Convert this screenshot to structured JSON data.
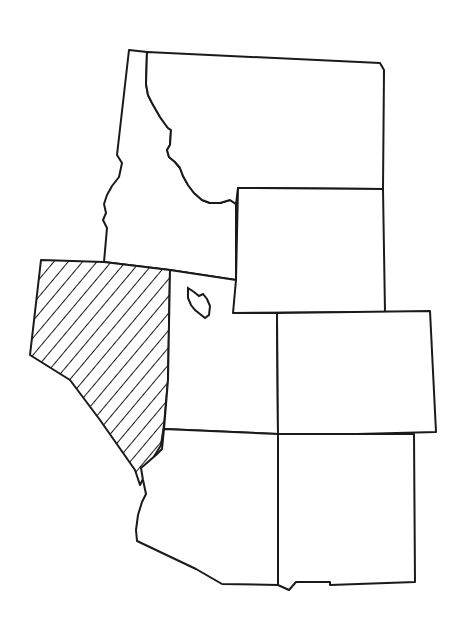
{
  "map": {
    "title": "",
    "region": "Mountain West United States",
    "style": {
      "line_color": "#1a1a1a",
      "background": "#ffffff",
      "hatch_color": "#1a1a1a"
    },
    "highlighted_state": "Nevada",
    "states": [
      {
        "name": "Idaho",
        "highlighted": false,
        "points": "129,50 147,52 146,84 148,95 152,103 156,110 160,117 165,124 168,128 171,130 170,145 167,150 169,157 175,162 180,168 183,176 188,185 194,193 202,200 210,203 220,203 230,200 236,204 236,280 170,270 104,262 107,228 103,220 106,213 104,204 107,195 112,186 119,177 122,163 117,155 129,50"
      },
      {
        "name": "Montana",
        "highlighted": false,
        "points": "147,52 380,63 384,70 383,189 238,188 236,204 230,200 220,203 210,203 202,200 194,193 188,185 183,176 180,168 175,162 169,157 167,150 170,145 171,130 168,128 165,124 160,117 156,110 152,103 148,95 146,84 147,52"
      },
      {
        "name": "Wyoming",
        "highlighted": false,
        "points": "238,188 383,189 385,312 233,313 233,280 236,280 238,188"
      },
      {
        "name": "Nevada",
        "highlighted": true,
        "points": "41,260 104,262 170,270 168,380 164,425 161,445 152,460 145,475 140,485 135,470 100,420 70,380 30,355 41,260"
      },
      {
        "name": "Utah",
        "highlighted": false,
        "points": "170,270 236,280 233,313 277,313 278,434 164,429 168,380 170,270"
      },
      {
        "name": "Colorado",
        "highlighted": false,
        "points": "277,313 430,311 436,432 278,436 277,313"
      },
      {
        "name": "Arizona",
        "highlighted": false,
        "points": "164,429 278,434 278,585 222,584 196,569 137,541 136,530 138,515 142,502 146,494 143,480 141,468 156,455 162,449 164,429"
      },
      {
        "name": "New Mexico",
        "highlighted": false,
        "points": "278,434 414,434 415,582 330,585 330,582 296,582 289,590 278,585 278,434"
      }
    ],
    "lakes": [
      {
        "name": "Great Salt Lake",
        "points": "188,288 194,292 199,296 203,294 207,299 210,306 209,315 205,318 200,314 195,310 191,305 188,298"
      }
    ]
  }
}
